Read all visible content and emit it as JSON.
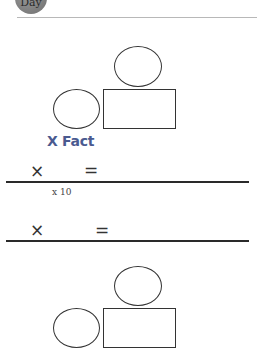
{
  "header": {
    "badge_label": "Day"
  },
  "section1": {
    "title": "X Fact",
    "equations": [
      {
        "times": "×",
        "equals": "=",
        "note": "x 10"
      },
      {
        "times": "×",
        "equals": "=",
        "note": ""
      }
    ]
  },
  "colors": {
    "title": "#4a5a90",
    "rule": "#2a2a2a",
    "badge": "#7a7a7a"
  }
}
